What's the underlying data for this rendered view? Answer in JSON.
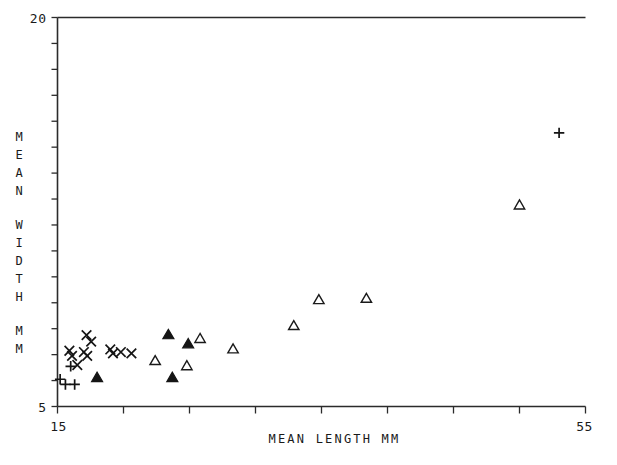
{
  "chart_data": {
    "type": "scatter",
    "title": "",
    "xlabel": "MEAN LENGTH  MM",
    "ylabel": "MEAN WIDTH MM",
    "xlim": [
      15,
      55
    ],
    "ylim": [
      5,
      20
    ],
    "xticks": [
      15,
      20,
      25,
      30,
      35,
      40,
      45,
      50,
      55
    ],
    "xtick_labels_shown": [
      "15",
      "55"
    ],
    "ytick_step": 1,
    "ytick_labels_shown": [
      "5",
      "20"
    ],
    "grid": false,
    "legend": "none",
    "series": [
      {
        "name": "plus",
        "marker": "plus",
        "points": [
          [
            15.2,
            6.05
          ],
          [
            15.6,
            5.85
          ],
          [
            16.3,
            5.85
          ],
          [
            16.0,
            6.55
          ],
          [
            53.0,
            15.55
          ]
        ]
      },
      {
        "name": "cross",
        "marker": "x",
        "points": [
          [
            16.5,
            6.6
          ],
          [
            17.2,
            7.75
          ],
          [
            17.55,
            7.5
          ],
          [
            17.0,
            7.1
          ],
          [
            17.25,
            6.95
          ],
          [
            19.0,
            7.2
          ],
          [
            19.2,
            7.05
          ],
          [
            19.8,
            7.1
          ],
          [
            20.6,
            7.05
          ],
          [
            15.9,
            7.15
          ],
          [
            16.1,
            6.95
          ]
        ]
      },
      {
        "name": "open-triangle",
        "marker": "triangle-open",
        "points": [
          [
            22.4,
            6.75
          ],
          [
            24.8,
            6.55
          ],
          [
            25.8,
            7.6
          ],
          [
            28.3,
            7.2
          ],
          [
            32.9,
            8.1
          ],
          [
            34.8,
            9.1
          ],
          [
            38.4,
            9.15
          ],
          [
            50.0,
            12.75
          ]
        ]
      },
      {
        "name": "filled-triangle",
        "marker": "triangle-filled",
        "points": [
          [
            18.0,
            6.1
          ],
          [
            23.4,
            7.75
          ],
          [
            24.9,
            7.4
          ],
          [
            23.7,
            6.1
          ]
        ]
      }
    ]
  },
  "axes": {
    "y_top_label": "20",
    "y_bottom_label": "5",
    "x_left_label": "15",
    "x_right_label": "55",
    "x_title": "MEAN LENGTH  MM",
    "y_title_lines": [
      "MEAN",
      "WIDTH",
      "MM"
    ]
  }
}
